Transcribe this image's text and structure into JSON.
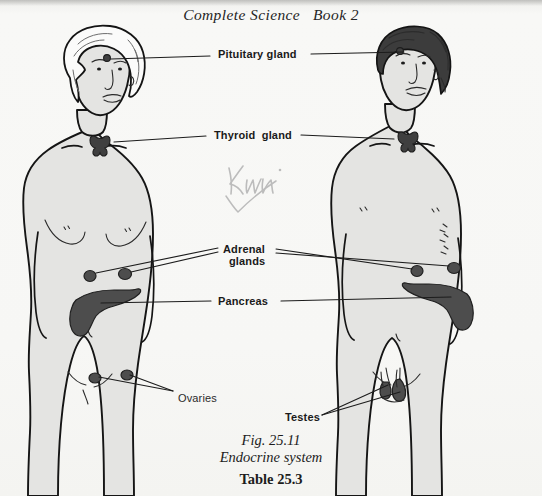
{
  "page": {
    "width": 542,
    "height": 496,
    "background_color": "#f6f6f4",
    "ink_color": "#1a1a1a",
    "body_fill_color": "#e3e3e1",
    "gland_fill_color": "#4a4a4a",
    "hair_dark_color": "#3a3a3a",
    "hair_light_color": "#fbfbfa"
  },
  "header": {
    "book_title": "Complete Science   Book 2"
  },
  "labels": [
    {
      "id": "pituitary",
      "text": "Pituitary gland",
      "x": 218,
      "y": 48,
      "weight": "bold"
    },
    {
      "id": "thyroid",
      "text": "Thyroid  gland",
      "x": 214,
      "y": 129,
      "weight": "bold"
    },
    {
      "id": "adrenal_line1",
      "text": "Adrenal",
      "x": 223,
      "y": 244,
      "weight": "bold"
    },
    {
      "id": "adrenal_line2",
      "text": "glands",
      "x": 228,
      "y": 256,
      "weight": "bold"
    },
    {
      "id": "pancreas",
      "text": "Pancreas",
      "x": 218,
      "y": 295,
      "weight": "bold"
    },
    {
      "id": "ovaries",
      "text": "Ovaries",
      "x": 178,
      "y": 393,
      "weight": "normal"
    },
    {
      "id": "testes",
      "text": "Testes",
      "x": 285,
      "y": 413,
      "weight": "bold"
    }
  ],
  "annotation": {
    "handwritten_note": "Know",
    "has_check_mark": true,
    "color": "#b9b9b9"
  },
  "caption": {
    "figure_number": "Fig. 25.11",
    "figure_title": "Endocrine system",
    "table_number": "Table 25.3"
  },
  "figures": [
    {
      "id": "female-figure",
      "name": "female-body-diagram",
      "side": "left",
      "hair": "light",
      "glands": [
        "pituitary",
        "thyroid",
        "adrenal-left",
        "adrenal-right",
        "pancreas",
        "ovary-left",
        "ovary-right"
      ]
    },
    {
      "id": "male-figure",
      "name": "male-body-diagram",
      "side": "right",
      "hair": "dark",
      "glands": [
        "pituitary",
        "thyroid",
        "adrenal-left",
        "adrenal-right",
        "pancreas",
        "testis-left",
        "testis-right"
      ]
    }
  ]
}
